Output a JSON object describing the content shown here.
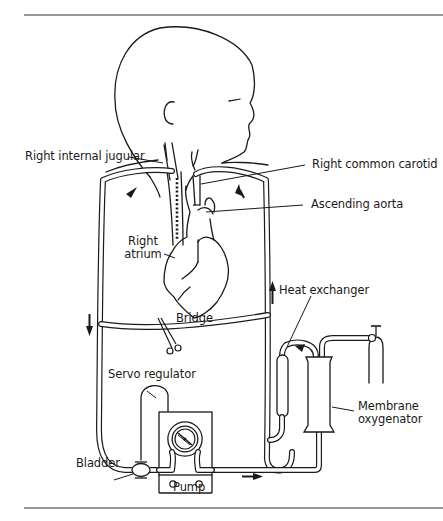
{
  "figure": {
    "rule_color": "#333333",
    "line_color": "#1a1a1a",
    "background": "#ffffff"
  },
  "labels": {
    "right_internal_jugular": "Right internal jugular",
    "right_common_carotid": "Right common carotid",
    "ascending_aorta": "Ascending aorta",
    "right_atrium_line1": "Right",
    "right_atrium_line2": "atrium",
    "heat_exchanger": "Heat exchanger",
    "bridge": "Bridge",
    "servo_regulator": "Servo regulator",
    "membrane_line1": "Membrane",
    "membrane_line2": "oxygenator",
    "bladder": "Bladder",
    "pump": "Pump"
  },
  "components": [
    {
      "id": "infant",
      "name": "Infant head and torso outline"
    },
    {
      "id": "venous-cannula",
      "name": "Right internal jugular venous cannula into right atrium"
    },
    {
      "id": "arterial-cannula",
      "name": "Right common carotid arterial cannula to ascending aorta"
    },
    {
      "id": "bridge",
      "name": "Bridge with clamp"
    },
    {
      "id": "bladder",
      "name": "Bladder"
    },
    {
      "id": "servo-regulator",
      "name": "Servo regulator"
    },
    {
      "id": "pump",
      "name": "Roller pump"
    },
    {
      "id": "membrane-oxygenator",
      "name": "Membrane oxygenator"
    },
    {
      "id": "heat-exchanger",
      "name": "Heat exchanger"
    },
    {
      "id": "gas-cylinder",
      "name": "Gas cylinder"
    }
  ],
  "flow_arrows": [
    {
      "id": "venous-outflow",
      "direction": "down-left"
    },
    {
      "id": "arterial-return",
      "direction": "up"
    },
    {
      "id": "left-limb",
      "direction": "down"
    },
    {
      "id": "right-limb",
      "direction": "up"
    },
    {
      "id": "pump-outflow",
      "direction": "right"
    },
    {
      "id": "heat-exchanger-flow",
      "direction": "left"
    }
  ]
}
